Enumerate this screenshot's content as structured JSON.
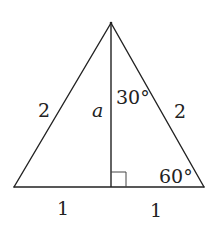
{
  "diagram": {
    "type": "geometry",
    "colors": {
      "stroke": "#222222",
      "background": "#ffffff"
    },
    "vertices": {
      "apex": [
        111,
        23
      ],
      "bottom_left": [
        14,
        187
      ],
      "bottom_right": [
        204,
        187
      ],
      "foot_of_altitude": [
        111,
        187
      ]
    },
    "right_angle_marker": {
      "x": 111,
      "y": 172,
      "size": 15
    },
    "labels": {
      "left_side": "2",
      "altitude": "a",
      "top_angle": "30°",
      "right_side": "2",
      "bottom_right_angle": "60°",
      "left_base": "1",
      "right_base": "1"
    }
  }
}
